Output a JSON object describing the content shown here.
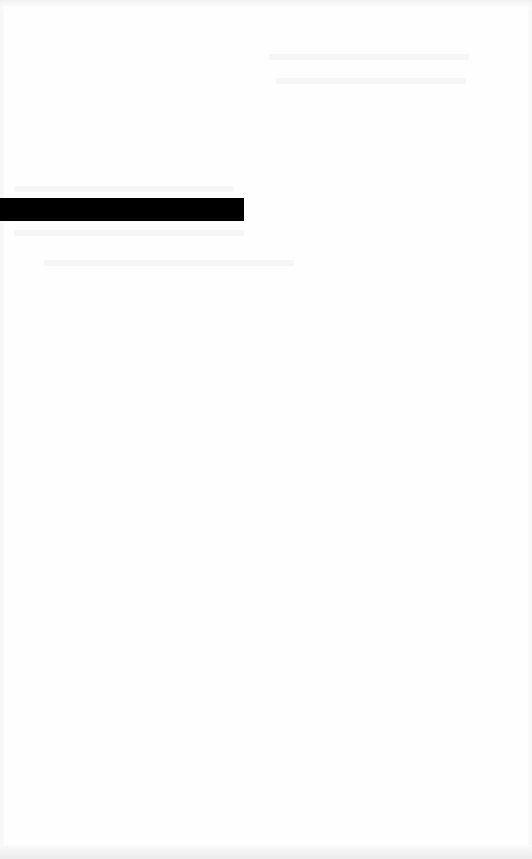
{
  "page": {
    "background": "#fefefe",
    "legible_text": []
  },
  "redaction_bar": {
    "color": "#000000"
  },
  "faint_text_regions": [
    {
      "area": "top-right",
      "lines": 2,
      "legible": false
    },
    {
      "area": "around-bar",
      "lines": 3,
      "legible": false
    }
  ]
}
